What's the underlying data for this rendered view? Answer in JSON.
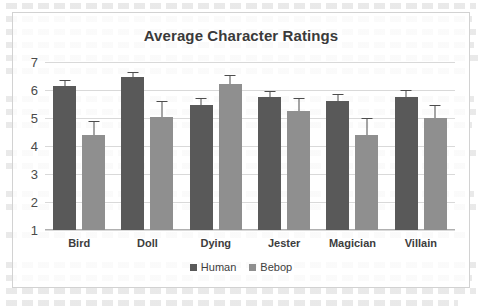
{
  "chart_data": {
    "type": "bar",
    "title": "Average Character Ratings",
    "xlabel": "",
    "ylabel": "",
    "ylim": [
      1,
      7
    ],
    "yticks": [
      7,
      6,
      5,
      4,
      3,
      2,
      1
    ],
    "grid": true,
    "legend_position": "bottom",
    "categories": [
      "Bird",
      "Doll",
      "Dying",
      "Jester",
      "Magician",
      "Villain"
    ],
    "series": [
      {
        "name": "Human",
        "color": "#595959",
        "values": [
          6.15,
          6.45,
          5.45,
          5.75,
          5.6,
          5.75
        ],
        "errors": [
          0.2,
          0.18,
          0.25,
          0.22,
          0.27,
          0.25
        ]
      },
      {
        "name": "Bebop",
        "color": "#8f8f8f",
        "values": [
          4.4,
          5.05,
          6.2,
          5.25,
          4.4,
          5.0
        ],
        "errors": [
          0.5,
          0.55,
          0.35,
          0.47,
          0.6,
          0.47
        ]
      }
    ]
  },
  "legend": {
    "items": [
      {
        "label": "Human",
        "swatch": "human-legend-swatch"
      },
      {
        "label": "Bebop",
        "swatch": "bebop-legend-swatch"
      }
    ]
  }
}
